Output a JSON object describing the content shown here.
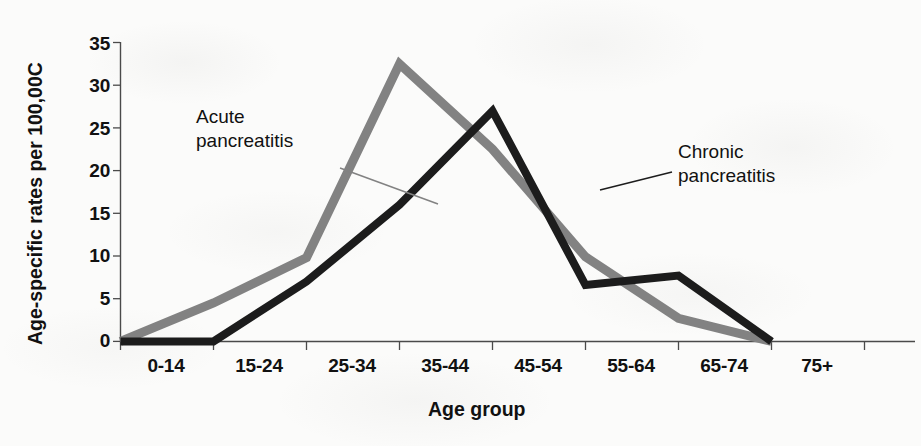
{
  "chart_data": {
    "type": "line",
    "title": "",
    "subtitle": "",
    "xlabel": "Age group",
    "ylabel": "Age-specific rates per 100,000",
    "ylabel_rendered": "Age-specific rates per 100,00C",
    "categories": [
      "0-14",
      "15-24",
      "25-34",
      "35-44",
      "45-54",
      "55-64",
      "65-74",
      "75+"
    ],
    "yticks": [
      0,
      5,
      10,
      15,
      20,
      25,
      30,
      35
    ],
    "ylim": [
      0,
      35
    ],
    "grid": false,
    "legend_position": "inline-annotations",
    "series": [
      {
        "name": "Acute pancreatitis",
        "color": "#828282",
        "values": [
          0,
          4.5,
          9.8,
          32.5,
          22.5,
          9.9,
          2.7,
          0
        ]
      },
      {
        "name": "Chronic pancreatitis",
        "color": "#1c1c1c",
        "values": [
          0,
          0,
          7.0,
          16.0,
          27.0,
          6.6,
          7.7,
          0
        ]
      }
    ],
    "annotations": [
      {
        "id": "acute-annotation",
        "text_line1": "Acute",
        "text_line2": "pancreatitis",
        "color": "#828282"
      },
      {
        "id": "chronic-annotation",
        "text_line1": "Chronic",
        "text_line2": "pancreatitis",
        "color": "#1c1c1c"
      }
    ]
  }
}
